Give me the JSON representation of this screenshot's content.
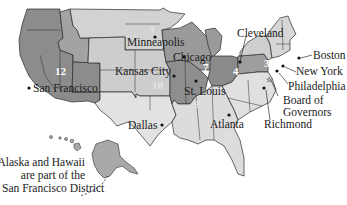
{
  "map": {
    "title": "Federal Reserve Districts",
    "colors": {
      "dark": "#8c8c8c",
      "mid": "#a9a9a9",
      "light": "#cfcfcf",
      "lighter": "#e2e2e2",
      "border": "#2a2a2a",
      "background": "#ffffff"
    },
    "districts": [
      {
        "number": "1",
        "city": "Boston"
      },
      {
        "number": "2",
        "city": "New York"
      },
      {
        "number": "3",
        "city": "Philadelphia"
      },
      {
        "number": "4",
        "city": "Cleveland"
      },
      {
        "number": "5",
        "city": "Richmond"
      },
      {
        "number": "6",
        "city": "Atlanta"
      },
      {
        "number": "7",
        "city": "Chicago"
      },
      {
        "number": "8",
        "city": "St. Louis"
      },
      {
        "number": "9",
        "city": "Minneapolis"
      },
      {
        "number": "10",
        "city": "Kansas City"
      },
      {
        "number": "11",
        "city": "Dallas"
      },
      {
        "number": "12",
        "city": "San Francisco"
      }
    ],
    "labels": {
      "board": "Board of Governors",
      "board_line1": "Board of",
      "board_line2": "Governors"
    },
    "note": {
      "line1": "Alaska and Hawaii",
      "line2": "are part of the",
      "line3": "San Francisco District"
    }
  }
}
